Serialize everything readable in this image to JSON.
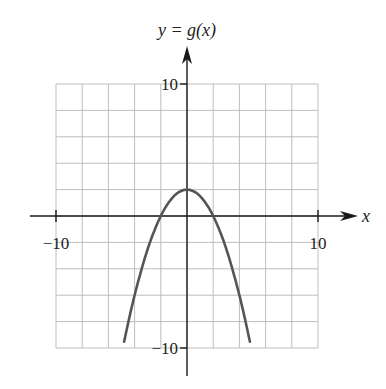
{
  "chart_data": {
    "type": "line",
    "title": "y = g(x)",
    "xlabel": "x",
    "ylabel": "y = g(x)",
    "xlim": [
      -10,
      10
    ],
    "ylim": [
      -10,
      10
    ],
    "grid": true,
    "grid_step": 2,
    "x_ticks": [
      {
        "value": -10,
        "label": "−10"
      },
      {
        "value": 10,
        "label": "10"
      }
    ],
    "y_ticks": [
      {
        "value": 10,
        "label": "10"
      },
      {
        "value": -10,
        "label": "−10"
      }
    ],
    "series": [
      {
        "name": "g(x)",
        "description": "downward parabola, vertex (0, 2), x-intercepts at ±2",
        "x": [
          -4.8,
          -4,
          -3,
          -2,
          -1,
          0,
          1,
          2,
          3,
          4,
          4.8
        ],
        "y": [
          -9.52,
          -6,
          -2.5,
          0,
          1.5,
          2,
          1.5,
          0,
          -2.5,
          -6,
          -9.52
        ]
      }
    ],
    "colors": {
      "curve": "#555555",
      "grid": "#bdbdbd",
      "axis": "#1a1a1a"
    }
  }
}
